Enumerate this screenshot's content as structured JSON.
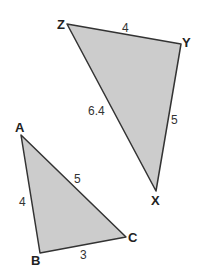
{
  "diagram": {
    "triangles": [
      {
        "name": "XYZ",
        "fill": "#cccccc",
        "stroke": "#333333",
        "vertices": {
          "Z": "Z",
          "Y": "Y",
          "X": "X"
        },
        "sides": {
          "ZY": "4",
          "YX": "5",
          "ZX": "6.4"
        }
      },
      {
        "name": "ABC",
        "fill": "#cccccc",
        "stroke": "#333333",
        "vertices": {
          "A": "A",
          "B": "B",
          "C": "C"
        },
        "sides": {
          "AB": "4",
          "BC": "3",
          "AC": "5"
        }
      }
    ]
  }
}
